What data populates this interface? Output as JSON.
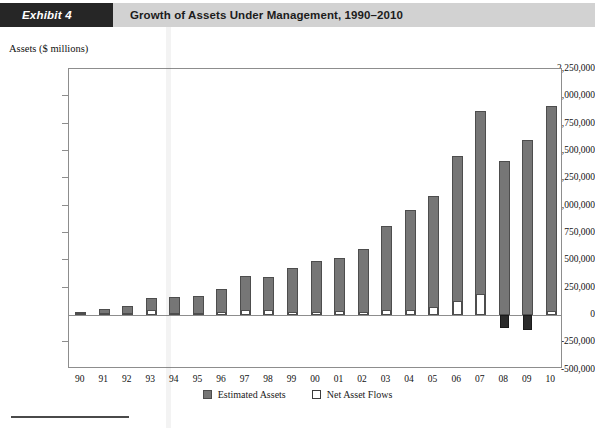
{
  "header": {
    "tag": "Exhibit 4",
    "title": "Growth of Assets Under Management, 1990–2010"
  },
  "footer": {
    "source_note": ""
  },
  "chart_data": {
    "type": "bar",
    "title": "Growth of Assets Under Management, 1990–2010",
    "subtitle": "",
    "ylabel": "Assets ($ millions)",
    "xlabel": "",
    "ylim": [
      -500000,
      2250000
    ],
    "ytick_step": 250000,
    "ytick_labels": [
      "2,250,000",
      "2,000,000",
      "1,750,000",
      "1,500,000",
      "1,250,000",
      "1,000,000",
      "750,000",
      "500,000",
      "250,000",
      "0",
      "-250,000",
      "-500,000"
    ],
    "ytick_values": [
      2250000,
      2000000,
      1750000,
      1500000,
      1250000,
      1000000,
      750000,
      500000,
      250000,
      0,
      -250000,
      -500000
    ],
    "categories": [
      "90",
      "91",
      "92",
      "93",
      "94",
      "95",
      "96",
      "97",
      "98",
      "99",
      "00",
      "01",
      "02",
      "03",
      "04",
      "05",
      "06",
      "07",
      "08",
      "09",
      "10"
    ],
    "grid": false,
    "legend_position": "bottom",
    "series": [
      {
        "name": "Estimated Assets",
        "color": "#767676",
        "values": [
          25000,
          55000,
          85000,
          155000,
          165000,
          175000,
          240000,
          355000,
          350000,
          430000,
          490000,
          525000,
          600000,
          815000,
          960000,
          1090000,
          1450000,
          1870000,
          1405000,
          1600000,
          1915000
        ]
      },
      {
        "name": "Net Asset Flows",
        "color": "#ffffff",
        "values": [
          8000,
          10000,
          22000,
          45000,
          18000,
          12000,
          25000,
          50000,
          45000,
          30000,
          30000,
          35000,
          28000,
          45000,
          50000,
          75000,
          130000,
          195000,
          -120000,
          -135000,
          35000
        ]
      }
    ]
  }
}
